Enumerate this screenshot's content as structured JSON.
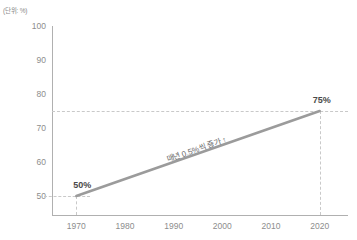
{
  "unit_caption": "(단위: %)",
  "chart_data": {
    "type": "line",
    "title": "",
    "subtitle": "",
    "xlabel": "",
    "ylabel": "",
    "unit": "(단위: %)",
    "x": [
      1970,
      2020
    ],
    "values": [
      50,
      75
    ],
    "series": [
      {
        "name": "비율",
        "x": [
          1970,
          2020
        ],
        "values": [
          50,
          75
        ]
      }
    ],
    "point_labels": [
      "50%",
      "75%"
    ],
    "xlim": [
      1965,
      2025
    ],
    "ylim": [
      45,
      100
    ],
    "xticks": [
      1970,
      1980,
      1990,
      2000,
      2010,
      2020
    ],
    "xticklabels": [
      "1970",
      "1980",
      "1990",
      "2000",
      "2010",
      "2020"
    ],
    "yticks": [
      50,
      60,
      70,
      80,
      90,
      100
    ],
    "yticklabels": [
      "50",
      "60",
      "70",
      "80",
      "90",
      "100"
    ],
    "grid": false,
    "legend": "none",
    "annotations": [
      {
        "text": "매년 0.5%씩 증가 ↑",
        "x": 1995,
        "y": 62.5
      }
    ],
    "guides": {
      "horizontal": [
        75,
        50
      ],
      "vertical": [
        1970,
        2020
      ]
    },
    "colors": {
      "line": "#9b9b9b",
      "axis": "#b0b0b0",
      "guide": "#c9c9c9",
      "tick_text": "#8d8d8d",
      "label_text": "#4a4a4a",
      "annotation_text": "#6b6b6b",
      "background": "#ffffff"
    }
  }
}
